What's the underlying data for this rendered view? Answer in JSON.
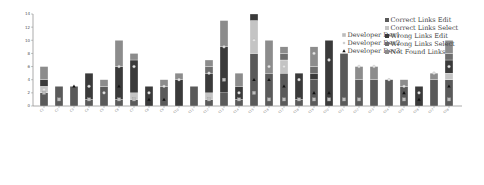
{
  "chart_data": {
    "type": "bar",
    "stacked": true,
    "title": "",
    "xlabel": "",
    "ylabel": "",
    "ylim": [
      0,
      14
    ],
    "yticks": [
      0,
      2,
      4,
      6,
      8,
      10,
      12,
      14
    ],
    "grid": false,
    "legend_position": "upper right",
    "categories": [
      "C1",
      "C2",
      "C3",
      "C4",
      "C5",
      "C6",
      "C7",
      "C8",
      "C9",
      "C10",
      "C11",
      "C12",
      "C13",
      "C14",
      "C15",
      "C16",
      "C17",
      "C18",
      "C19",
      "C20",
      "C21",
      "C22",
      "C23",
      "C24",
      "C25",
      "C26",
      "C27",
      "C28"
    ],
    "series": [
      {
        "name": "Correct Links Edit",
        "color": "#5a5a5a",
        "values": [
          2,
          3,
          3,
          1,
          3,
          1,
          1,
          0,
          3,
          0,
          3,
          1,
          2,
          1,
          8,
          5,
          5,
          1,
          4,
          0,
          8,
          4,
          4,
          4,
          3,
          0,
          4,
          4
        ]
      },
      {
        "name": "Correct Links Select",
        "color": "#c4c4c4",
        "values": [
          1,
          0,
          0,
          0,
          0,
          0,
          1,
          0,
          0,
          0,
          0,
          1,
          0,
          0,
          5,
          0,
          2,
          0,
          0,
          0,
          0,
          0,
          0,
          0,
          0,
          0,
          0,
          1
        ]
      },
      {
        "name": "Wrong Links Edit",
        "color": "#3a3a3a",
        "values": [
          1,
          0,
          0,
          4,
          0,
          5,
          5,
          3,
          0,
          4,
          0,
          3,
          7,
          2,
          1,
          0,
          0,
          4,
          1,
          10,
          0,
          0,
          0,
          0,
          0,
          3,
          0,
          2
        ]
      },
      {
        "name": "Wrong Links Select",
        "color": "#6e6e6e",
        "values": [
          0,
          0,
          0,
          0,
          0,
          0,
          0,
          0,
          0,
          0,
          0,
          1,
          0,
          0,
          0,
          0,
          1,
          0,
          1,
          0,
          0,
          0,
          0,
          0,
          0,
          0,
          0,
          1
        ]
      },
      {
        "name": "Not Found Links",
        "color": "#8c8c8c",
        "values": [
          2,
          0,
          0,
          0,
          1,
          4,
          1,
          0,
          1,
          1,
          0,
          1,
          4,
          2,
          0,
          5,
          1,
          0,
          3,
          0,
          0,
          2,
          2,
          0,
          1,
          0,
          1,
          2
        ]
      }
    ],
    "totals": [
      6,
      3,
      3,
      5,
      4,
      10,
      8,
      3,
      4,
      5,
      3,
      7,
      13,
      5,
      14,
      10,
      9,
      5,
      9,
      10,
      8,
      6,
      6,
      4,
      4,
      3,
      5,
      10
    ],
    "markers": [
      {
        "name": "Developer Dev1",
        "shape": "square",
        "color": "#bdbdbd",
        "values": [
          2,
          1,
          0,
          1,
          0,
          1,
          1,
          0,
          0,
          0,
          0,
          1,
          4,
          1,
          2,
          1,
          1,
          1,
          1,
          1,
          1,
          1,
          0,
          0,
          1,
          0,
          0,
          1
        ]
      },
      {
        "name": "Developer Dev2",
        "shape": "circle",
        "color": "#e6e6e6",
        "values": [
          2.5,
          0,
          0,
          3,
          2,
          6,
          6,
          2,
          3,
          4,
          0,
          5,
          9,
          2,
          10,
          6,
          6,
          4,
          8,
          7,
          0,
          6,
          6,
          4,
          3,
          2,
          5,
          6
        ]
      },
      {
        "name": "Developer Dev3",
        "shape": "triangle",
        "color": "#111111",
        "values": [
          0,
          0,
          3,
          0,
          0,
          3,
          0,
          1,
          1,
          0,
          0,
          0,
          0,
          0,
          4,
          4,
          3,
          0,
          2,
          2,
          0,
          0,
          0,
          0,
          2,
          1,
          0,
          3
        ]
      }
    ]
  },
  "legend": {
    "bars": [
      "Correct Links Edit",
      "Correct Links Select",
      "Wrong Links Edit",
      "Wrong Links Select",
      "Not Found Links"
    ],
    "markers": [
      "Developer Dev1",
      "Developer Dev2",
      "Developer Dev3"
    ]
  }
}
